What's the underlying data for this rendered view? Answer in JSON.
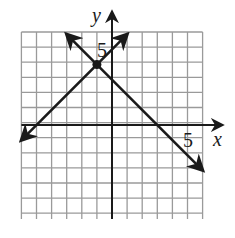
{
  "chart_data": {
    "type": "line",
    "title": "",
    "xlabel": "x",
    "ylabel": "y",
    "xlim": [
      -6,
      6
    ],
    "ylim": [
      -6,
      6
    ],
    "grid": true,
    "tick_labels": {
      "x": [
        "5"
      ],
      "y": [
        "5"
      ]
    },
    "series": [
      {
        "name": "line-1",
        "equation": "y = x + 5",
        "slope": 1,
        "intercept": 5,
        "x": [
          -6,
          1
        ],
        "y": [
          -1,
          6
        ]
      },
      {
        "name": "line-2",
        "equation": "y = -x + 3",
        "slope": -1,
        "intercept": 3,
        "x": [
          -3,
          6
        ],
        "y": [
          6,
          -3
        ]
      }
    ],
    "annotations": [
      {
        "type": "point",
        "label": "intersection",
        "x": -1,
        "y": 4
      }
    ]
  },
  "axes": {
    "x_label": "x",
    "y_label": "y",
    "x_tick": "5",
    "y_tick": "5"
  },
  "colors": {
    "grid": "#9a9a9a",
    "axis": "#1a1a1a",
    "line": "#1a1a1a"
  }
}
